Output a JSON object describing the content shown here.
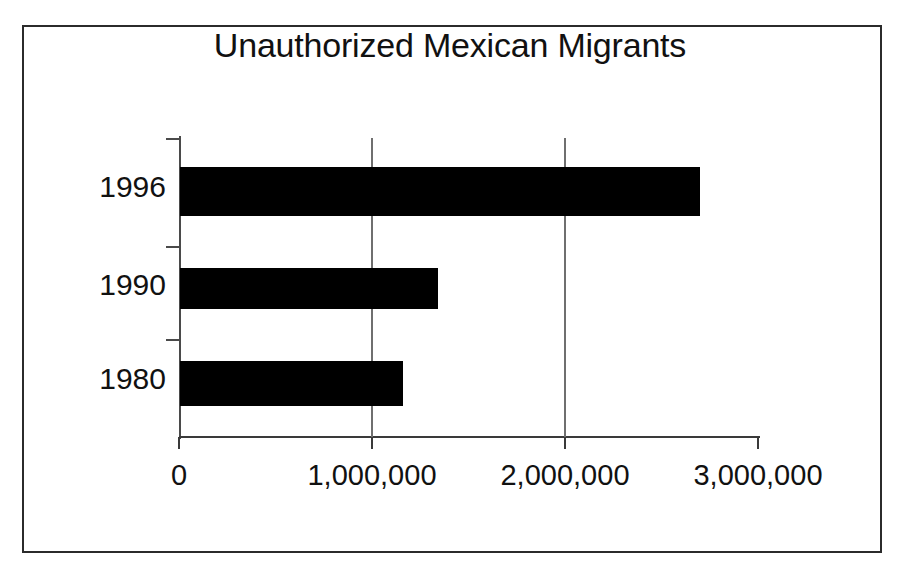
{
  "figure": {
    "title": "Unauthorized Mexican Migrants",
    "background_color": "#ffffff",
    "bar_color": "#000000",
    "axis_color": "#3a3a3a",
    "border_color": "#2b2b2b"
  },
  "chart_data": {
    "type": "bar",
    "orientation": "horizontal",
    "title": "Unauthorized Mexican Migrants",
    "xlabel": "",
    "ylabel": "",
    "categories": [
      "1996",
      "1990",
      "1980"
    ],
    "values": [
      2700000,
      1340000,
      1160000
    ],
    "series": [
      {
        "name": "Unauthorized Mexican Migrants",
        "values": [
          2700000,
          1340000,
          1160000
        ]
      }
    ],
    "xlim": [
      0,
      3000000
    ],
    "xticks": [
      0,
      1000000,
      2000000,
      3000000
    ],
    "xticklabels": [
      "0",
      "1,000,000",
      "2,000,000",
      "3,000,000"
    ],
    "yticklabels": [
      "1996",
      "1990",
      "1980"
    ],
    "grid": "vertical",
    "legend": "none",
    "bar_color": "#000000"
  }
}
